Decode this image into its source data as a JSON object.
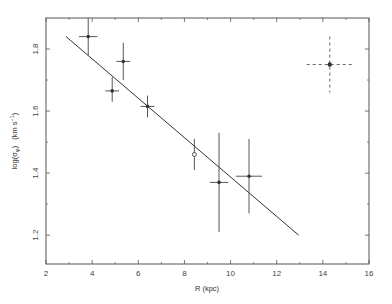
{
  "chart_data": {
    "type": "scatter",
    "title": "",
    "xlabel": "R (kpc)",
    "ylabel": "log(σ_φ) (km s⁻¹)",
    "ylabel_parts": {
      "main": "log(σ",
      "sub": "φ",
      "close": ")",
      "units_open": "(km s",
      "sup": "−1",
      "units_close": ")"
    },
    "xlim": [
      2,
      16
    ],
    "ylim": [
      1.107,
      1.9
    ],
    "x_ticks": [
      2,
      4,
      6,
      8,
      10,
      12,
      14,
      16
    ],
    "x_tick_labels": [
      "2",
      "4",
      "6",
      "8",
      "10",
      "12",
      "14",
      "16"
    ],
    "x_minor_ticks": [
      3,
      5,
      7,
      9,
      11,
      13,
      15
    ],
    "y_ticks": [
      1.2,
      1.4,
      1.6,
      1.8
    ],
    "y_tick_labels": [
      "1.2",
      "1.4",
      "1.6",
      "1.8"
    ],
    "y_minor_ticks": [
      1.3,
      1.5,
      1.7
    ],
    "grid": false,
    "points": [
      {
        "x": 3.83,
        "y": 1.84,
        "xerr": 0.4,
        "y_low": 1.78,
        "y_high": 1.9,
        "marker": "filled"
      },
      {
        "x": 4.87,
        "y": 1.665,
        "xerr": 0.3,
        "y_low": 1.63,
        "y_high": 1.71,
        "marker": "filled"
      },
      {
        "x": 5.35,
        "y": 1.76,
        "xerr": 0.3,
        "y_low": 1.7,
        "y_high": 1.82,
        "marker": "filled"
      },
      {
        "x": 6.4,
        "y": 1.615,
        "xerr": 0.3,
        "y_low": 1.58,
        "y_high": 1.65,
        "marker": "filled"
      },
      {
        "x": 8.43,
        "y": 1.46,
        "xerr": 0.0,
        "y_low": 1.41,
        "y_high": 1.51,
        "marker": "open"
      },
      {
        "x": 9.5,
        "y": 1.37,
        "xerr": 0.4,
        "y_low": 1.21,
        "y_high": 1.53,
        "marker": "filled"
      },
      {
        "x": 10.8,
        "y": 1.39,
        "xerr": 0.57,
        "y_low": 1.27,
        "y_high": 1.51,
        "marker": "filled"
      }
    ],
    "fit_line": {
      "x": [
        2.87,
        12.95
      ],
      "y": [
        1.84,
        1.2
      ]
    },
    "typical_error": {
      "x": 14.3,
      "y": 1.75,
      "xerr": 1.0,
      "y_low": 1.66,
      "y_high": 1.84,
      "style": "dashed",
      "placement": "top-right"
    }
  }
}
